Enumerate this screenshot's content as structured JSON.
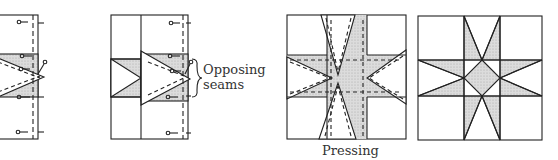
{
  "figure": {
    "panels": [
      {
        "id": "panel-1",
        "description": "Half block with pinned star point triangles"
      },
      {
        "id": "panel-2",
        "description": "Joined units with opposing seams",
        "annotation": "Opposing\nseams"
      },
      {
        "id": "panel-3",
        "description": "Pressing seams of assembled star block",
        "caption": "Pressing"
      },
      {
        "id": "panel-4",
        "description": "Finished eight-pointed star block"
      }
    ],
    "labels": {
      "opposing_line1": "Opposing",
      "opposing_line2": "seams",
      "pressing": "Pressing"
    },
    "colors": {
      "line": "#222222",
      "shade": "#d4d4d4",
      "background": "#ffffff"
    }
  }
}
